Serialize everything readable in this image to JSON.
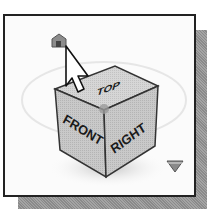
{
  "viewcube": {
    "faces": {
      "top": "TOP",
      "front": "FRONT",
      "right": "RIGHT"
    },
    "home_icon": "house-icon",
    "menu_icon": "triangle-down-icon",
    "cursor_icon": "arrow-cursor-icon"
  },
  "colors": {
    "face_fill": "#c6c6c6",
    "top_fill": "#d2d2d2",
    "edge": "#333333",
    "frame_border": "#222222",
    "shadow": "#9a9a9a",
    "home_fill": "#8a8a8a"
  }
}
